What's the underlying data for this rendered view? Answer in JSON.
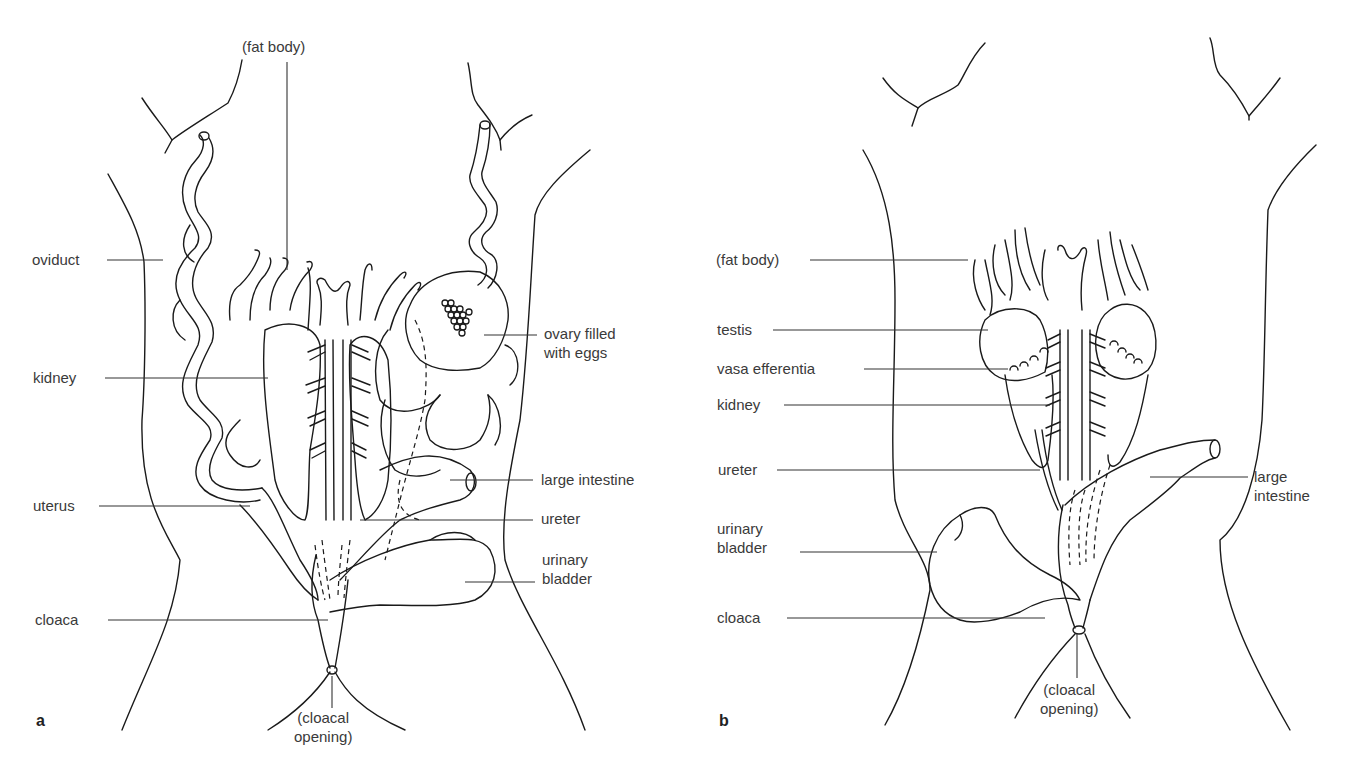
{
  "figure": {
    "panels": [
      {
        "id": "a",
        "letter": "a",
        "subject": "female",
        "labels": {
          "fat_body": "(fat body)",
          "oviduct": "oviduct",
          "kidney": "kidney",
          "uterus": "uterus",
          "cloaca": "cloaca",
          "cloacal_opening": "(cloacal\nopening)",
          "ovary": "ovary filled\nwith eggs",
          "large_intestine": "large intestine",
          "ureter": "ureter",
          "urinary_bladder": "urinary\nbladder"
        }
      },
      {
        "id": "b",
        "letter": "b",
        "subject": "male",
        "labels": {
          "fat_body": "(fat body)",
          "testis": "testis",
          "vasa_efferentia": "vasa efferentia",
          "kidney": "kidney",
          "ureter": "ureter",
          "urinary_bladder": "urinary\nbladder",
          "cloaca": "cloaca",
          "cloacal_opening": "(cloacal\nopening)",
          "large_intestine": "large\nintestine"
        }
      }
    ]
  },
  "style": {
    "line_color": "#1a1a1a",
    "label_color": "#3a3a3a",
    "background": "#ffffff"
  }
}
